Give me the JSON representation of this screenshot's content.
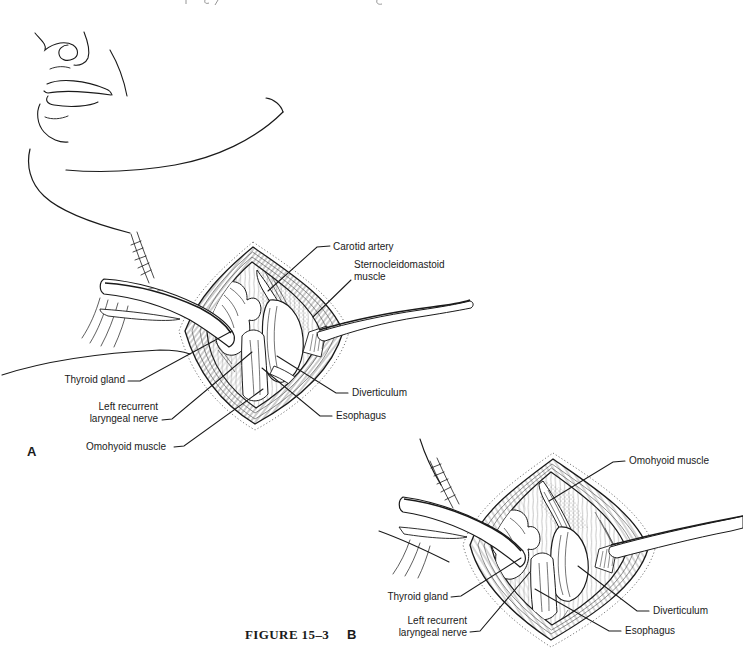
{
  "page": {
    "background": "#ffffff",
    "ink_color": "#1a1a1a"
  },
  "figure_caption": {
    "label": "FIGURE 15–3"
  },
  "panels": {
    "a": {
      "letter": "A",
      "labels": {
        "carotid_artery": "Carotid artery",
        "sternocleidomastoid_line1": "Sternocleidomastoid",
        "sternocleidomastoid_line2": "muscle",
        "thyroid_gland": "Thyroid gland",
        "left_recurrent_line1": "Left recurrent",
        "left_recurrent_line2": "laryngeal nerve",
        "omohyoid_muscle": "Omohyoid muscle",
        "diverticulum": "Diverticulum",
        "esophagus": "Esophagus"
      }
    },
    "b": {
      "letter": "B",
      "labels": {
        "omohyoid_muscle": "Omohyoid muscle",
        "thyroid_gland": "Thyroid gland",
        "left_recurrent_line1": "Left recurrent",
        "left_recurrent_line2": "laryngeal nerve",
        "diverticulum": "Diverticulum",
        "esophagus": "Esophagus"
      }
    }
  }
}
